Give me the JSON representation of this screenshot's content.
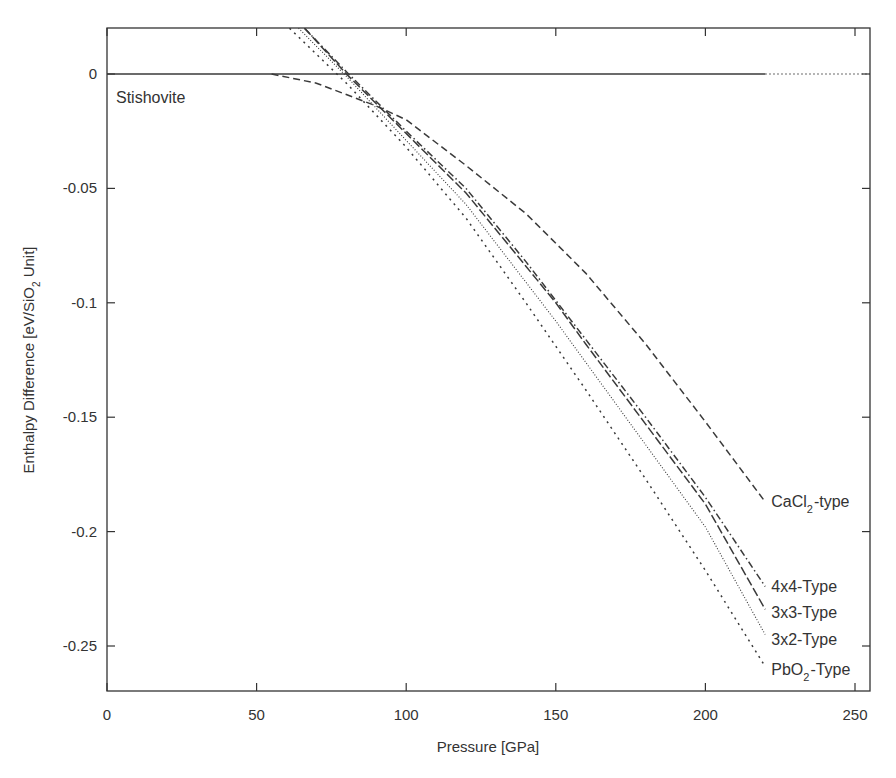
{
  "chart_data": {
    "type": "line",
    "title": "",
    "xlabel": "Pressure [GPa]",
    "ylabel": "Enthalpy Difference [eV/SiO2 Unit]",
    "xlim": [
      0,
      255
    ],
    "ylim": [
      -0.27,
      0.02
    ],
    "xticks": [
      0,
      50,
      100,
      150,
      200,
      250
    ],
    "yticks": [
      0,
      -0.05,
      -0.1,
      -0.15,
      -0.2,
      -0.25
    ],
    "ytick_labels": [
      "0",
      "-0.05",
      "-0.1",
      "-0.15",
      "-0.2",
      "-0.25"
    ],
    "grid": false,
    "legend": "inline labels at line ends (right side)",
    "reference": {
      "name": "Stishovite",
      "label": "Stishovite",
      "value": 0,
      "solid_until": 220,
      "dotted_until": 255
    },
    "series": [
      {
        "name": "CaCl2-type",
        "label_main": "CaCl",
        "label_sub": "2",
        "label_tail": "-type",
        "style": "dashed",
        "x": [
          55,
          70,
          90,
          100,
          120,
          140,
          150,
          160,
          180,
          200,
          220
        ],
        "y": [
          0.0,
          -0.004,
          -0.014,
          -0.02,
          -0.04,
          -0.061,
          -0.074,
          -0.087,
          -0.118,
          -0.152,
          -0.187
        ]
      },
      {
        "name": "4x4-Type",
        "label_main": "4x4-Type",
        "label_sub": "",
        "label_tail": "",
        "style": "dashdot",
        "x": [
          66,
          80,
          90,
          100,
          120,
          140,
          150,
          160,
          180,
          200,
          220
        ],
        "y": [
          0.02,
          0.001,
          -0.012,
          -0.025,
          -0.05,
          -0.082,
          -0.099,
          -0.116,
          -0.15,
          -0.185,
          -0.224
        ]
      },
      {
        "name": "3x3-Type",
        "label_main": "3x3-Type",
        "label_sub": "",
        "label_tail": "",
        "style": "longdash",
        "x": [
          66,
          80,
          90,
          100,
          120,
          140,
          150,
          160,
          180,
          200,
          220
        ],
        "y": [
          0.02,
          0.0,
          -0.013,
          -0.026,
          -0.052,
          -0.084,
          -0.1,
          -0.118,
          -0.153,
          -0.188,
          -0.234
        ]
      },
      {
        "name": "3x2-Type",
        "label_main": "3x2-Type",
        "label_sub": "",
        "label_tail": "",
        "style": "dotted",
        "x": [
          64,
          80,
          90,
          100,
          120,
          140,
          150,
          160,
          180,
          200,
          220
        ],
        "y": [
          0.02,
          -0.001,
          -0.015,
          -0.029,
          -0.057,
          -0.091,
          -0.108,
          -0.126,
          -0.162,
          -0.198,
          -0.245
        ]
      },
      {
        "name": "PbO2-Type",
        "label_main": "PbO",
        "label_sub": "2",
        "label_tail": "-Type",
        "style": "sparsedot",
        "x": [
          61,
          80,
          90,
          100,
          120,
          140,
          150,
          160,
          180,
          200,
          220
        ],
        "y": [
          0.02,
          -0.004,
          -0.018,
          -0.032,
          -0.063,
          -0.1,
          -0.119,
          -0.138,
          -0.177,
          -0.217,
          -0.259
        ]
      }
    ]
  },
  "caption": "",
  "colors": {
    "line": "#3a3a3a",
    "axis": "#333333",
    "background": "#ffffff"
  }
}
